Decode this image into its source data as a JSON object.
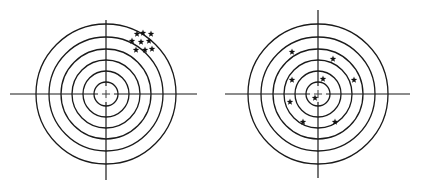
{
  "figure": {
    "stroke_color": "#1a1a1a",
    "star_color": "#111111",
    "ring_radii": [
      12,
      23,
      34,
      45,
      57,
      70
    ]
  },
  "targets": [
    {
      "name": "left-target",
      "grouping": "clustered off-center (upper right)",
      "center": [
        106,
        94
      ],
      "hline": [
        10,
        197
      ],
      "vline": [
        20,
        180
      ],
      "shots": [
        [
          137,
          34
        ],
        [
          143,
          33
        ],
        [
          151,
          34
        ],
        [
          132,
          41
        ],
        [
          141,
          42
        ],
        [
          149,
          41
        ],
        [
          136,
          50
        ],
        [
          145,
          50
        ],
        [
          152,
          49
        ]
      ]
    },
    {
      "name": "right-target",
      "grouping": "scattered around center",
      "center": [
        318,
        94
      ],
      "hline": [
        225,
        410
      ],
      "vline": [
        10,
        178
      ],
      "shots": [
        [
          292,
          52
        ],
        [
          333,
          59
        ],
        [
          292,
          80
        ],
        [
          323,
          79
        ],
        [
          354,
          80
        ],
        [
          315,
          98
        ],
        [
          290,
          102
        ],
        [
          303,
          122
        ],
        [
          335,
          122
        ]
      ]
    }
  ]
}
